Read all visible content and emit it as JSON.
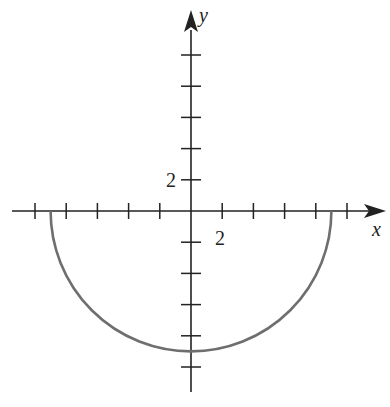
{
  "chart_data": {
    "type": "line",
    "title": "",
    "xlabel": "x",
    "ylabel": "y",
    "x_tick_step": 2,
    "y_tick_step": 2,
    "x_tick_label": "2",
    "y_tick_label": "2",
    "xlim": [
      -11,
      12.5
    ],
    "ylim": [
      -11.8,
      10.5
    ],
    "x_ticks": [
      -10,
      -8,
      -6,
      -4,
      -2,
      2,
      4,
      6,
      8,
      10
    ],
    "y_ticks": [
      -10,
      -8,
      -6,
      -4,
      -2,
      2,
      4,
      6,
      8,
      10
    ],
    "grid": false,
    "series": [
      {
        "name": "lower semicircle",
        "description": "y = -sqrt(81 - x^2), radius 9 centered at origin",
        "radius": 9,
        "x": [
          -9,
          -8,
          -6,
          -4,
          -2,
          0,
          2,
          4,
          6,
          8,
          9
        ],
        "values": [
          0,
          -4.12,
          -6.71,
          -8.06,
          -8.77,
          -9,
          -8.77,
          -8.06,
          -6.71,
          -4.12,
          0
        ],
        "color": "#6e6e6e"
      }
    ]
  },
  "style": {
    "axis_color": "#222222",
    "curve_color": "#6e6e6e"
  }
}
